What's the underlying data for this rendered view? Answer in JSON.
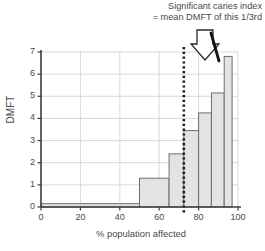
{
  "annotation": {
    "line1": "Significant caries index",
    "line2": "= mean DMFT of this 1/3rd",
    "arrow_icon": "down-arrow-icon"
  },
  "chart_data": {
    "type": "bar",
    "title": "",
    "xlabel": "% population affected",
    "ylabel": "DMFT",
    "xlim": [
      0,
      100
    ],
    "ylim": [
      0,
      7
    ],
    "xticks": [
      0,
      20,
      40,
      60,
      80,
      100
    ],
    "yticks": [
      0,
      1,
      2,
      3,
      4,
      5,
      6,
      7
    ],
    "grid": true,
    "legend": "none",
    "bar_fill": "#e3e3e3",
    "bar_edge": "#6e6e6e",
    "axis_color": "#3c3c3c",
    "grid_color": "#cfcfcf",
    "bars": [
      {
        "x0": 0,
        "x1": 50,
        "value": 0.15
      },
      {
        "x0": 50,
        "x1": 65,
        "value": 1.3
      },
      {
        "x0": 65,
        "x1": 72.5,
        "value": 2.4
      },
      {
        "x0": 72.5,
        "x1": 80,
        "value": 3.45
      },
      {
        "x0": 80,
        "x1": 86.5,
        "value": 4.25
      },
      {
        "x0": 86.5,
        "x1": 93,
        "value": 5.15
      },
      {
        "x0": 93,
        "x1": 97,
        "value": 6.8
      }
    ],
    "threshold_line": {
      "x": 72.5,
      "style": "dotted",
      "color": "#1a1a1a",
      "label": ""
    }
  }
}
